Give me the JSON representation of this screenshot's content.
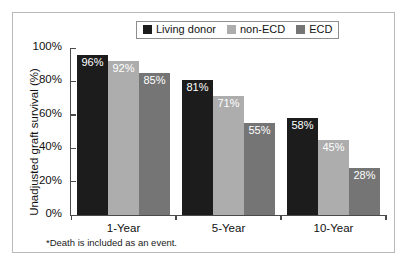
{
  "chart_data": {
    "type": "bar",
    "title": "",
    "xlabel": "",
    "ylabel": "Unadjusted graft survival (%)",
    "categories": [
      "1-Year",
      "5-Year",
      "10-Year"
    ],
    "series": [
      {
        "name": "Living donor",
        "color": "#1c1c1c",
        "values": [
          96,
          92,
          85
        ]
      },
      {
        "name": "non-ECD",
        "color": "#adadad",
        "values": [
          81,
          71,
          55
        ]
      },
      {
        "name": "ECD",
        "color": "#757575",
        "values": [
          58,
          45,
          28
        ]
      }
    ],
    "grouped_values": [
      {
        "category": "1-Year",
        "bars": [
          {
            "series": "Living donor",
            "value": 96,
            "label": "96%",
            "color": "#1c1c1c"
          },
          {
            "series": "non-ECD",
            "value": 92,
            "label": "92%",
            "color": "#adadad"
          },
          {
            "series": "ECD",
            "value": 85,
            "label": "85%",
            "color": "#757575"
          }
        ]
      },
      {
        "category": "5-Year",
        "bars": [
          {
            "series": "Living donor",
            "value": 81,
            "label": "81%",
            "color": "#1c1c1c"
          },
          {
            "series": "non-ECD",
            "value": 71,
            "label": "71%",
            "color": "#adadad"
          },
          {
            "series": "ECD",
            "value": 55,
            "label": "55%",
            "color": "#757575"
          }
        ]
      },
      {
        "category": "10-Year",
        "bars": [
          {
            "series": "Living donor",
            "value": 58,
            "label": "58%",
            "color": "#1c1c1c"
          },
          {
            "series": "non-ECD",
            "value": 45,
            "label": "45%",
            "color": "#adadad"
          },
          {
            "series": "ECD",
            "value": 28,
            "label": "28%",
            "color": "#757575"
          }
        ]
      }
    ],
    "ylim": [
      0,
      100
    ],
    "yticks": [
      0,
      20,
      40,
      60,
      80,
      100
    ],
    "ytick_labels": [
      "0%",
      "20%",
      "40%",
      "60%",
      "80%",
      "100%"
    ],
    "grid": false,
    "legend_position": "top-center",
    "legend_entries": [
      "Living donor",
      "non-ECD",
      "ECD"
    ]
  },
  "legend": {
    "items": [
      {
        "label": "Living donor",
        "color": "#1c1c1c"
      },
      {
        "label": "non-ECD",
        "color": "#adadad"
      },
      {
        "label": "ECD",
        "color": "#757575"
      }
    ]
  },
  "axes": {
    "y_title": "Unadjusted graft survival (%)",
    "y_tick_labels": [
      "100%",
      "80%",
      "60%",
      "40%",
      "20%",
      "0%"
    ],
    "x_tick_labels": [
      "1-Year",
      "5-Year",
      "10-Year"
    ]
  },
  "footnote": "*Death is included as an event."
}
